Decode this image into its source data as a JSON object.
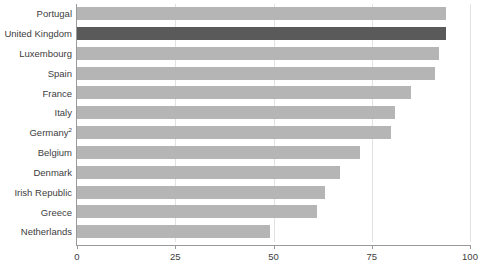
{
  "chart_data": {
    "type": "bar",
    "orientation": "horizontal",
    "title": "",
    "subtitle": "",
    "xlabel": "",
    "ylabel": "",
    "xlim": [
      0,
      100
    ],
    "ylim": null,
    "grid": true,
    "legend": null,
    "xticks": [
      "0",
      "25",
      "50",
      "75",
      "100"
    ],
    "xtick_values": [
      0,
      25,
      50,
      75,
      100
    ],
    "categories": [
      "Portugal",
      "United Kingdom",
      "Luxembourg",
      "Spain",
      "France",
      "Italy",
      "Germany",
      "Belgium",
      "Denmark",
      "Irish Republic",
      "Greece",
      "Netherlands"
    ],
    "category_footnotes": {
      "Germany": "2"
    },
    "values": [
      94,
      94,
      92,
      91,
      85,
      81,
      80,
      72,
      67,
      63,
      61,
      49
    ],
    "highlighted_category": "United Kingdom",
    "colors": {
      "bar": "#b5b5b5",
      "bar_highlight": "#5a5a5a",
      "gridline": "#e2e2e2",
      "axis": "#9a9a9a",
      "text": "#3d3d3d",
      "background": "#ffffff"
    },
    "annotations": []
  }
}
